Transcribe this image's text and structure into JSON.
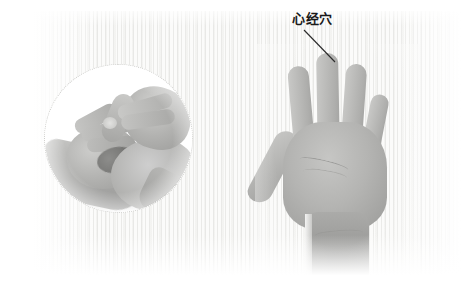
{
  "figure": {
    "type": "acupressure-illustration",
    "width": 471,
    "height": 291,
    "background_color": "#ffffff",
    "panel_color": "#fbfbfa"
  },
  "annotation": {
    "label": "心经穴",
    "label_color": "#1a1a1a",
    "leader_line_color": "#2b2b2b",
    "points_to": "middle-fingertip-of-open-palm"
  },
  "inset": {
    "name": "massage-technique-inset",
    "shape": "circle",
    "border_style": "dotted",
    "border_color": "#cfcfcc",
    "description": "hands-performing-finger-massage"
  },
  "main_photo": {
    "name": "open-palm-hand",
    "description": "open-left-palm-facing-viewer",
    "skin_tone": "#b4b4b2",
    "shadow_tone": "#8f8f8d"
  }
}
